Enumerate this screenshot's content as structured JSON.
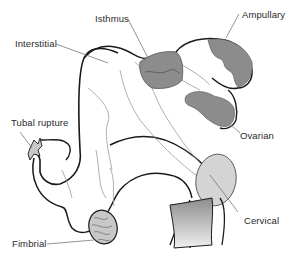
{
  "diagram": {
    "labels": {
      "isthmus": "Isthmus",
      "ampullary": "Ampullary",
      "interstitial": "Interstitial",
      "tubal_rupture": "Tubal rupture",
      "ovarian": "Ovarian",
      "cervical": "Cervical",
      "fimbrial": "Fimbrial"
    },
    "colors": {
      "outline": "#1a1a1a",
      "thin_line": "#9a9a9a",
      "dark_fill": "#8c8c8c",
      "light_fill": "#d4d4d4",
      "leader": "#777777",
      "text": "#2a2a2a"
    }
  }
}
